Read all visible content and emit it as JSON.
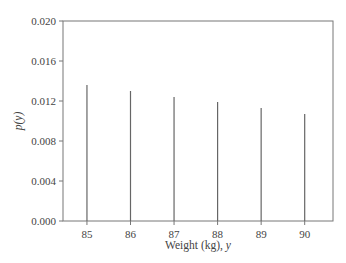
{
  "chart_data": {
    "type": "bar",
    "subtype": "stem",
    "title": "",
    "xlabel": "Weight (kg), y",
    "xlabel_parts": {
      "text": "Weight (kg), ",
      "var": "y"
    },
    "ylabel": "p(y)",
    "categories": [
      "85",
      "86",
      "87",
      "88",
      "89",
      "90"
    ],
    "x": [
      85,
      86,
      87,
      88,
      89,
      90
    ],
    "values": [
      0.0136,
      0.013,
      0.0124,
      0.0119,
      0.0113,
      0.0107
    ],
    "ylim": [
      0.0,
      0.02
    ],
    "xlim": [
      84.45,
      90.65
    ],
    "yticks": [
      "0.000",
      "0.004",
      "0.008",
      "0.012",
      "0.016",
      "0.020"
    ],
    "ytick_values": [
      0.0,
      0.004,
      0.008,
      0.012,
      0.016,
      0.02
    ],
    "xticks": [
      "85",
      "86",
      "87",
      "88",
      "89",
      "90"
    ],
    "grid": false,
    "legend": null,
    "colors": {
      "axis": "#555555",
      "stem": "#666666",
      "text": "#444444"
    }
  }
}
